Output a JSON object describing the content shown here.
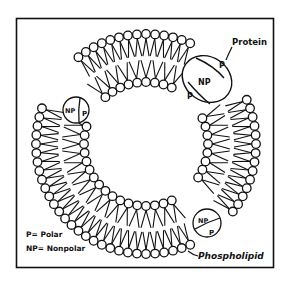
{
  "diagram": {
    "labels": {
      "protein": "Protein",
      "phospholipid": "Phospholipid",
      "legend_polar": "P= Polar",
      "legend_nonpolar": "NP= Nonpolar"
    },
    "proteins": [
      {
        "name": "large-transmembrane-protein",
        "regions": [
          "P",
          "NP",
          "P"
        ]
      },
      {
        "name": "left-embedded-protein",
        "regions": [
          "NP",
          "P"
        ]
      },
      {
        "name": "bottom-right-embedded-protein",
        "regions": [
          "NP",
          "P"
        ]
      }
    ],
    "colors": {
      "ink": "#111111",
      "paper": "#ffffff"
    }
  }
}
